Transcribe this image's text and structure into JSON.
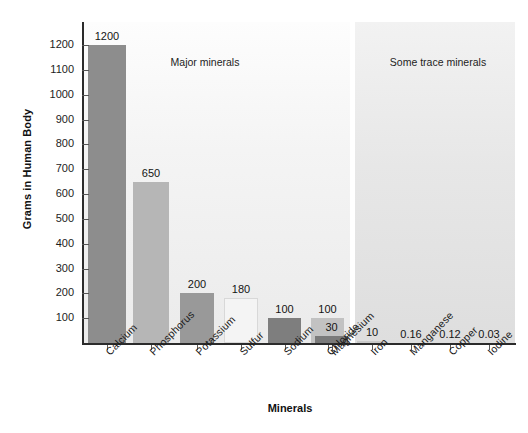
{
  "chart_data": {
    "type": "bar",
    "title": "",
    "xlabel": "Minerals",
    "ylabel": "Grams in Human Body",
    "ylim": [
      0,
      1250
    ],
    "grid": false,
    "categories": [
      "Calcium",
      "Phosphorus",
      "Potassium",
      "Sulfur",
      "Sodium",
      "Chloride",
      "Magnesium",
      "Iron",
      "Manganese",
      "Copper",
      "Iodine"
    ],
    "values": [
      1200,
      650,
      200,
      180,
      100,
      100,
      30,
      10,
      0.16,
      0.12,
      0.03
    ],
    "value_labels": [
      "1200",
      "650",
      "200",
      "180",
      "100",
      "100",
      "30",
      "10",
      "0.16",
      "0.12",
      "0.03"
    ],
    "bar_colors": [
      "#8d8d8d",
      "#b6b6b6",
      "#999999",
      "#f4f4f4",
      "#7e7e7e",
      "#c2c2c2",
      "#7a7a7a",
      "#c9c9c9",
      "#d0d0d0",
      "#d0d0d0",
      "#d0d0d0"
    ],
    "ytick_labels": [
      "1200",
      "1100",
      "1000",
      "900",
      "800",
      "700",
      "600",
      "500",
      "400",
      "300",
      "200",
      "100"
    ],
    "ytick_values": [
      1200,
      1100,
      1000,
      900,
      800,
      700,
      600,
      500,
      400,
      300,
      200,
      100
    ],
    "panels": [
      {
        "name": "major",
        "label": "Major minerals",
        "categories": [
          "Calcium",
          "Phosphorus",
          "Potassium",
          "Sulfur",
          "Sodium",
          "Chloride",
          "Magnesium"
        ]
      },
      {
        "name": "trace",
        "label": "Some trace minerals",
        "categories": [
          "Iron",
          "Manganese",
          "Copper",
          "Iodine"
        ]
      }
    ],
    "legend": "none"
  },
  "colors": {
    "axis": "#2b2b2b",
    "text": "#1a1a1a",
    "panel_major_bg": "#f4f4f4",
    "panel_trace_bg": "#e7e7e7"
  }
}
